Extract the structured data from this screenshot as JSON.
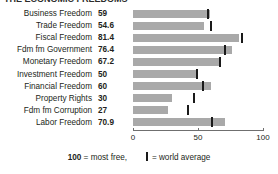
{
  "title_sliver": "THE ECONOMIC FREEDOMS",
  "chart_data": {
    "type": "bar",
    "orientation": "horizontal",
    "title": "",
    "xlabel": "",
    "ylabel": "",
    "xlim": [
      0,
      100
    ],
    "xticks": [
      0,
      50,
      100
    ],
    "xtick_labels": [
      "0",
      "50",
      "100"
    ],
    "grid": false,
    "bar_color": "#a9a9a9",
    "marker_color": "#1a1a1a",
    "legend": {
      "position": "bottom",
      "scale_note_value": "100",
      "scale_note_text": "= most free,",
      "marker_text": "= world average"
    },
    "categories": [
      "Business Freedom",
      "Trade Freedom",
      "Fiscal Freedom",
      "Fdm fm Government",
      "Monetary Freedom",
      "Investment Freedom",
      "Financial Freedom",
      "Property Rights",
      "Fdm fm Corruption",
      "Labor Freedom"
    ],
    "series": [
      {
        "name": "Country score",
        "values": [
          59,
          54.6,
          81.4,
          76.4,
          67.2,
          50,
          60,
          30,
          27,
          70.9
        ],
        "value_labels": [
          "59",
          "54.6",
          "81.4",
          "76.4",
          "67.2",
          "50",
          "60",
          "30",
          "27",
          "70.9"
        ]
      },
      {
        "name": "World average",
        "type": "marker",
        "values": [
          58,
          60,
          84,
          71,
          67,
          49,
          54,
          47,
          42,
          61
        ]
      }
    ]
  }
}
